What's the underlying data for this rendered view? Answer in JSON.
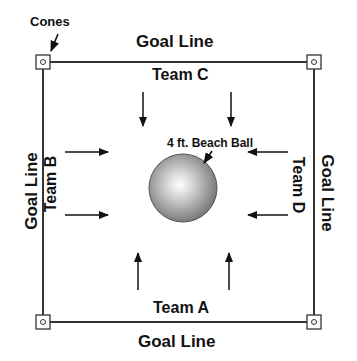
{
  "labels": {
    "cones": "Cones",
    "goal_top": "Goal Line",
    "goal_bottom": "Goal Line",
    "goal_left": "Goal Line",
    "goal_right": "Goal Line",
    "team_a": "Team A",
    "team_b": "Team B",
    "team_c": "Team C",
    "team_d": "Team D",
    "ball": "4 ft. Beach Ball"
  },
  "field": {
    "corners": [
      [
        43,
        62
      ],
      [
        314,
        62
      ],
      [
        314,
        322
      ],
      [
        43,
        322
      ]
    ],
    "line_color": "#333333"
  },
  "ball": {
    "cx": 183,
    "cy": 188,
    "r": 34,
    "highlight": "#ffffff",
    "shade": "#7a7a7a"
  },
  "arrows": [
    {
      "team": "C",
      "dir": "down",
      "from": [
        143,
        92
      ],
      "to": [
        143,
        126
      ]
    },
    {
      "team": "C",
      "dir": "down",
      "from": [
        231,
        92
      ],
      "to": [
        231,
        126
      ]
    },
    {
      "team": "A",
      "dir": "up",
      "from": [
        138,
        290
      ],
      "to": [
        138,
        253
      ]
    },
    {
      "team": "A",
      "dir": "up",
      "from": [
        229,
        290
      ],
      "to": [
        229,
        253
      ]
    },
    {
      "team": "B",
      "dir": "right",
      "from": [
        65,
        152
      ],
      "to": [
        108,
        152
      ]
    },
    {
      "team": "B",
      "dir": "right",
      "from": [
        65,
        215
      ],
      "to": [
        108,
        215
      ]
    },
    {
      "team": "D",
      "dir": "left",
      "from": [
        288,
        152
      ],
      "to": [
        248,
        152
      ]
    },
    {
      "team": "D",
      "dir": "left",
      "from": [
        288,
        215
      ],
      "to": [
        248,
        215
      ]
    }
  ]
}
